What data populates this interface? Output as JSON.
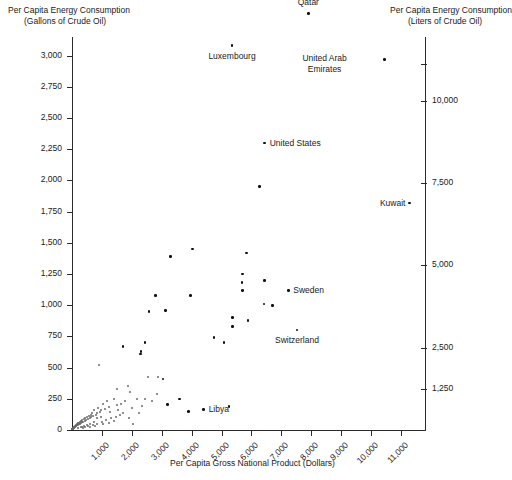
{
  "chart_data": {
    "type": "scatter",
    "title": "",
    "xlabel": "Per Capita Gross National Product (Dollars)",
    "ylabel_left_line1": "Per Capita Energy Consumption",
    "ylabel_left_line2": "(Gallons of Crude Oil)",
    "ylabel_right_line1": "Per Capita Energy Consumption",
    "ylabel_right_line2": "(Liters of Crude Oil)",
    "xlim": [
      0,
      11800
    ],
    "ylim_left": [
      0,
      3150
    ],
    "grid": false,
    "legend": "none",
    "xticks": [
      "1,000",
      "2,000",
      "3,000",
      "4,000",
      "5,000",
      "6,000",
      "7,000",
      "8,000",
      "9,000",
      "10,000",
      "11,000"
    ],
    "xtick_values": [
      1000,
      2000,
      3000,
      4000,
      5000,
      6000,
      7000,
      8000,
      9000,
      10000,
      11000
    ],
    "yticks_left": [
      "0",
      "250",
      "500",
      "750",
      "1,000",
      "1,250",
      "1,500",
      "1,750",
      "2,000",
      "2,250",
      "2,500",
      "2,750",
      "3,000"
    ],
    "ytick_values_left": [
      0,
      250,
      500,
      750,
      1000,
      1250,
      1500,
      1750,
      2000,
      2250,
      2500,
      2750,
      3000
    ],
    "yticks_right": [
      "1,250",
      "2,500",
      "5,000",
      "7,500",
      "10,000"
    ],
    "ytick_values_right": [
      1250,
      2500,
      5000,
      7500,
      10000
    ],
    "annotations": [
      {
        "label": "Qatar",
        "x": 7900,
        "y": 3340,
        "placement": "above"
      },
      {
        "label": "Luxembourg",
        "x": 5350,
        "y": 3080,
        "placement": "below"
      },
      {
        "label": "United Arab Emirates",
        "x": 10450,
        "y": 2970,
        "placement": "left-two-line"
      },
      {
        "label": "United States",
        "x": 6440,
        "y": 2300,
        "placement": "right"
      },
      {
        "label": "Kuwait",
        "x": 11280,
        "y": 1820,
        "placement": "left"
      },
      {
        "label": "Sweden",
        "x": 7230,
        "y": 1120,
        "placement": "right"
      },
      {
        "label": "Switzerland",
        "x": 7520,
        "y": 800,
        "placement": "below"
      },
      {
        "label": "Libya",
        "x": 4400,
        "y": 165,
        "placement": "right"
      }
    ],
    "points": [
      {
        "x": 7900,
        "y": 3340
      },
      {
        "x": 5350,
        "y": 3080
      },
      {
        "x": 10450,
        "y": 2970
      },
      {
        "x": 6440,
        "y": 2300
      },
      {
        "x": 11280,
        "y": 1820
      },
      {
        "x": 6270,
        "y": 1950
      },
      {
        "x": 5840,
        "y": 1420
      },
      {
        "x": 4020,
        "y": 1450
      },
      {
        "x": 3300,
        "y": 1390
      },
      {
        "x": 5700,
        "y": 1250
      },
      {
        "x": 5680,
        "y": 1180
      },
      {
        "x": 5690,
        "y": 1120
      },
      {
        "x": 7230,
        "y": 1120
      },
      {
        "x": 6440,
        "y": 1200
      },
      {
        "x": 3960,
        "y": 1080
      },
      {
        "x": 6420,
        "y": 1010
      },
      {
        "x": 6700,
        "y": 1000
      },
      {
        "x": 2790,
        "y": 1080
      },
      {
        "x": 3130,
        "y": 960
      },
      {
        "x": 2580,
        "y": 950
      },
      {
        "x": 5360,
        "y": 900
      },
      {
        "x": 5370,
        "y": 830
      },
      {
        "x": 7520,
        "y": 800
      },
      {
        "x": 5880,
        "y": 880
      },
      {
        "x": 4750,
        "y": 740
      },
      {
        "x": 5080,
        "y": 700
      },
      {
        "x": 2440,
        "y": 700
      },
      {
        "x": 2310,
        "y": 630
      },
      {
        "x": 1700,
        "y": 670
      },
      {
        "x": 2290,
        "y": 610
      },
      {
        "x": 900,
        "y": 520
      },
      {
        "x": 2900,
        "y": 420
      },
      {
        "x": 2560,
        "y": 420
      },
      {
        "x": 3040,
        "y": 410
      },
      {
        "x": 1520,
        "y": 330
      },
      {
        "x": 1880,
        "y": 350
      },
      {
        "x": 1960,
        "y": 300
      },
      {
        "x": 2450,
        "y": 250
      },
      {
        "x": 2180,
        "y": 245
      },
      {
        "x": 1780,
        "y": 230
      },
      {
        "x": 1640,
        "y": 210
      },
      {
        "x": 1500,
        "y": 195
      },
      {
        "x": 1430,
        "y": 250
      },
      {
        "x": 1250,
        "y": 185
      },
      {
        "x": 1180,
        "y": 230
      },
      {
        "x": 1120,
        "y": 165
      },
      {
        "x": 1050,
        "y": 210
      },
      {
        "x": 980,
        "y": 160
      },
      {
        "x": 930,
        "y": 145
      },
      {
        "x": 880,
        "y": 175
      },
      {
        "x": 840,
        "y": 130
      },
      {
        "x": 800,
        "y": 120
      },
      {
        "x": 760,
        "y": 155
      },
      {
        "x": 720,
        "y": 110
      },
      {
        "x": 690,
        "y": 135
      },
      {
        "x": 660,
        "y": 100
      },
      {
        "x": 630,
        "y": 120
      },
      {
        "x": 600,
        "y": 95
      },
      {
        "x": 570,
        "y": 110
      },
      {
        "x": 540,
        "y": 85
      },
      {
        "x": 510,
        "y": 100
      },
      {
        "x": 480,
        "y": 78
      },
      {
        "x": 455,
        "y": 92
      },
      {
        "x": 430,
        "y": 70
      },
      {
        "x": 405,
        "y": 85
      },
      {
        "x": 385,
        "y": 62
      },
      {
        "x": 360,
        "y": 75
      },
      {
        "x": 340,
        "y": 58
      },
      {
        "x": 320,
        "y": 68
      },
      {
        "x": 300,
        "y": 52
      },
      {
        "x": 285,
        "y": 62
      },
      {
        "x": 265,
        "y": 46
      },
      {
        "x": 250,
        "y": 56
      },
      {
        "x": 235,
        "y": 42
      },
      {
        "x": 220,
        "y": 50
      },
      {
        "x": 205,
        "y": 38
      },
      {
        "x": 195,
        "y": 46
      },
      {
        "x": 180,
        "y": 34
      },
      {
        "x": 170,
        "y": 42
      },
      {
        "x": 158,
        "y": 30
      },
      {
        "x": 148,
        "y": 38
      },
      {
        "x": 138,
        "y": 26
      },
      {
        "x": 128,
        "y": 33
      },
      {
        "x": 118,
        "y": 22
      },
      {
        "x": 110,
        "y": 29
      },
      {
        "x": 100,
        "y": 19
      },
      {
        "x": 92,
        "y": 25
      },
      {
        "x": 85,
        "y": 16
      },
      {
        "x": 78,
        "y": 21
      },
      {
        "x": 70,
        "y": 13
      },
      {
        "x": 64,
        "y": 18
      },
      {
        "x": 58,
        "y": 11
      },
      {
        "x": 52,
        "y": 15
      },
      {
        "x": 46,
        "y": 9
      },
      {
        "x": 41,
        "y": 13
      },
      {
        "x": 36,
        "y": 8
      },
      {
        "x": 31,
        "y": 11
      },
      {
        "x": 27,
        "y": 6
      },
      {
        "x": 23,
        "y": 9
      },
      {
        "x": 19,
        "y": 5
      },
      {
        "x": 16,
        "y": 8
      },
      {
        "x": 13,
        "y": 4
      },
      {
        "x": 220,
        "y": 12
      },
      {
        "x": 300,
        "y": 18
      },
      {
        "x": 380,
        "y": 15
      },
      {
        "x": 460,
        "y": 22
      },
      {
        "x": 540,
        "y": 28
      },
      {
        "x": 620,
        "y": 20
      },
      {
        "x": 700,
        "y": 35
      },
      {
        "x": 780,
        "y": 30
      },
      {
        "x": 860,
        "y": 45
      },
      {
        "x": 1000,
        "y": 60
      },
      {
        "x": 1150,
        "y": 75
      },
      {
        "x": 1330,
        "y": 90
      },
      {
        "x": 1480,
        "y": 105
      },
      {
        "x": 1620,
        "y": 120
      },
      {
        "x": 1050,
        "y": 42
      },
      {
        "x": 1240,
        "y": 55
      },
      {
        "x": 1400,
        "y": 68
      },
      {
        "x": 2030,
        "y": 170
      },
      {
        "x": 2350,
        "y": 190
      },
      {
        "x": 2700,
        "y": 230
      },
      {
        "x": 3200,
        "y": 205
      },
      {
        "x": 3600,
        "y": 250
      },
      {
        "x": 4400,
        "y": 165
      },
      {
        "x": 5250,
        "y": 190
      },
      {
        "x": 2050,
        "y": 45
      },
      {
        "x": 1900,
        "y": 95
      },
      {
        "x": 2250,
        "y": 130
      },
      {
        "x": 860,
        "y": 95
      },
      {
        "x": 740,
        "y": 62
      },
      {
        "x": 610,
        "y": 48
      },
      {
        "x": 500,
        "y": 35
      },
      {
        "x": 410,
        "y": 28
      },
      {
        "x": 340,
        "y": 22
      },
      {
        "x": 3900,
        "y": 150
      },
      {
        "x": 2850,
        "y": 290
      },
      {
        "x": 1280,
        "y": 140
      },
      {
        "x": 1560,
        "y": 160
      },
      {
        "x": 970,
        "y": 105
      },
      {
        "x": 1700,
        "y": 130
      }
    ]
  }
}
